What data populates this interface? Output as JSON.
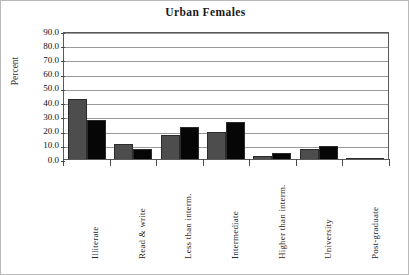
{
  "chart_data": {
    "type": "bar",
    "title": "Urban Females",
    "xlabel": "",
    "ylabel": "Percent",
    "ylim": [
      0,
      90
    ],
    "ytick_step": 10,
    "ytick_labels": [
      "90.0",
      "80.0",
      "70.0",
      "60.0",
      "50.0",
      "40.0",
      "30.0",
      "20.0",
      "10.0",
      "0.0"
    ],
    "grid": true,
    "legend": "none",
    "categories": [
      "Illiterate",
      "Read & write",
      "Less than interm.",
      "Intermediate",
      "Higher than interm.",
      "University",
      "Post-graduate"
    ],
    "series": [
      {
        "name": "series-1",
        "color": "#4d4d4d",
        "values": [
          42.5,
          10.4,
          16.8,
          18.8,
          2.0,
          7.0,
          0.5
        ]
      },
      {
        "name": "series-2",
        "color": "#060606",
        "values": [
          27.5,
          7.0,
          22.3,
          25.8,
          4.0,
          9.5,
          0.6
        ]
      }
    ]
  },
  "figure": {
    "border_color": "#b9b9b9",
    "plot_border_color": "#5a5a5a",
    "gridline_color": "#9a9a9a",
    "background": "#ffffff"
  }
}
